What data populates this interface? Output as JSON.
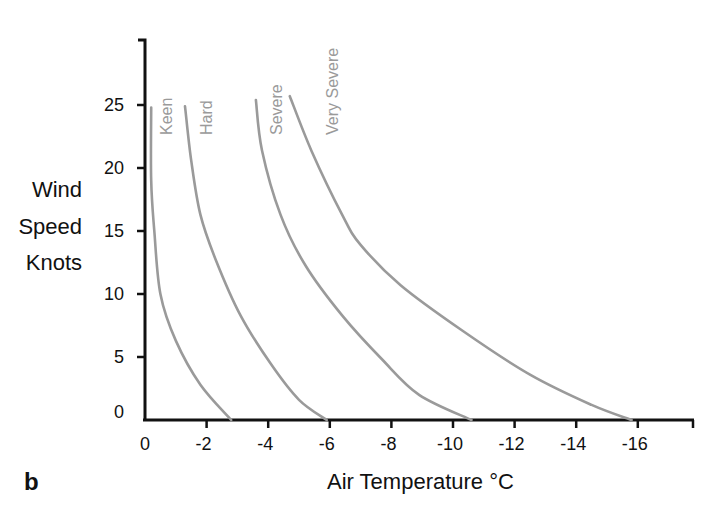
{
  "chart_data": {
    "type": "line",
    "title": "",
    "panel_label": "b",
    "xlabel": "Air Temperature °C",
    "ylabel_lines": [
      "Wind",
      "Speed",
      "Knots"
    ],
    "xlim": [
      0,
      -18
    ],
    "ylim": [
      0,
      30
    ],
    "x_ticks": [
      0,
      -2,
      -4,
      -6,
      -8,
      -10,
      -12,
      -14,
      -16
    ],
    "x_tick_labels": [
      "0",
      "-2",
      "-4",
      "-6",
      "-8",
      "-10",
      "-12",
      "-14",
      "-16"
    ],
    "y_ticks": [
      0,
      5,
      10,
      15,
      20,
      25
    ],
    "y_tick_labels": [
      "0",
      "5",
      "10",
      "15",
      "20",
      "25"
    ],
    "grid": false,
    "legend": "inline rotated labels at top of each curve",
    "series": [
      {
        "name": "Keen",
        "x": [
          -0.2,
          -0.2,
          -0.3,
          -0.5,
          -1.0,
          -1.8,
          -2.8
        ],
        "y": [
          24.8,
          19.0,
          15.1,
          10.0,
          6.3,
          2.8,
          0
        ]
      },
      {
        "name": "Hard",
        "x": [
          -1.3,
          -1.5,
          -1.8,
          -2.3,
          -3.1,
          -4.1,
          -5.0,
          -5.9
        ],
        "y": [
          24.9,
          20.6,
          16.3,
          12.7,
          8.3,
          4.4,
          1.6,
          0
        ]
      },
      {
        "name": "Severe",
        "x": [
          -3.6,
          -3.8,
          -4.4,
          -5.2,
          -6.4,
          -7.7,
          -8.9,
          -10.6
        ],
        "y": [
          25.4,
          21.4,
          16.3,
          12.3,
          8.3,
          4.8,
          2.0,
          0
        ]
      },
      {
        "name": "Very Severe",
        "x": [
          -4.7,
          -5.4,
          -6.4,
          -7.0,
          -8.3,
          -10.3,
          -12.5,
          -14.5,
          -15.8
        ],
        "y": [
          25.7,
          21.4,
          16.3,
          13.9,
          10.7,
          7.1,
          3.6,
          1.2,
          0
        ]
      }
    ]
  },
  "colors": {
    "axis": "#111111",
    "curve": "#9a9a9a",
    "curve_label": "#9a9a9a",
    "background": "#ffffff"
  }
}
